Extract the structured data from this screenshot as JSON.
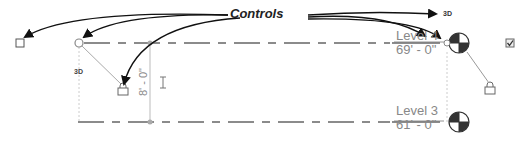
{
  "callout": {
    "label": "Controls"
  },
  "labels": {
    "three_d_top": "3D",
    "three_d_left": "3D"
  },
  "levels": [
    {
      "name": "Level 4",
      "elevation": "69' - 0\""
    },
    {
      "name": "Level 3",
      "elevation": "61' - 0\""
    }
  ],
  "dimension": {
    "value": "8' - 0\""
  },
  "colors": {
    "arrow": "#111111",
    "level_line": "#666666",
    "faint": "#bbbbbb",
    "text_gray": "#888888"
  }
}
